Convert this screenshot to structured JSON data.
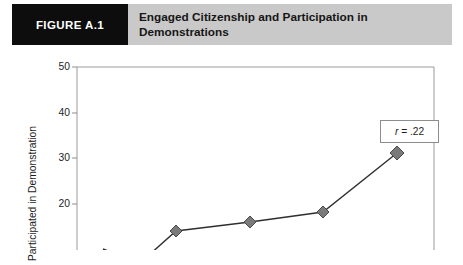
{
  "header": {
    "tag": "FIGURE A.1",
    "title": "Engaged Citizenship and Participation in Demonstrations",
    "tag_bg": "#0d0d0d",
    "banner_bg": "#c9c9c9"
  },
  "chart_data": {
    "type": "line",
    "title": "Engaged Citizenship and Participation in Demonstrations",
    "xlabel": "",
    "ylabel": "Participated in Demonstration",
    "ylim": [
      10,
      50
    ],
    "yticks": [
      50,
      40,
      30,
      20
    ],
    "ytick_labels": [
      "50",
      "40",
      "30",
      "20"
    ],
    "grid": false,
    "legend": "none",
    "annotation": "r = .22",
    "annotation_symbol": "r",
    "annotation_value": "= .22",
    "series": [
      {
        "name": "Participated in Demonstration",
        "x": [
          1,
          2,
          3,
          4,
          5,
          6
        ],
        "values": [
          10,
          13,
          17,
          19,
          21,
          34
        ],
        "marker": "diamond",
        "marker_color": "#7a7a7a",
        "line_color": "#2f2f2f"
      }
    ],
    "note": "plot is cropped at the bottom of the image; lowest points fall below the visible area"
  }
}
